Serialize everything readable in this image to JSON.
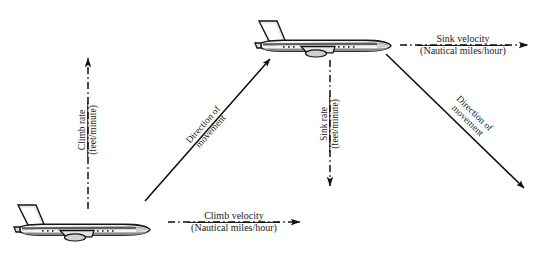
{
  "figure": {
    "background_color": "#ffffff",
    "line_color": "#1a1a1a",
    "width": 556,
    "height": 254
  },
  "labels": {
    "climb_rate": {
      "numerator": "Climb rate",
      "denominator": "(feet/minute)",
      "orientation": "vertical-up"
    },
    "climb_velocity": {
      "numerator": "Climb velocity",
      "denominator": "(Nautical miles/hour)",
      "orientation": "horizontal-right"
    },
    "sink_rate": {
      "numerator": "Sink rate",
      "denominator": "(feet/minute)",
      "orientation": "vertical-down"
    },
    "sink_velocity": {
      "numerator": "Sink velocity",
      "denominator": "(Nautical miles/hour)",
      "orientation": "horizontal-right"
    },
    "direction_climb": {
      "line1": "Direction of",
      "line2": "movement"
    },
    "direction_descent": {
      "line1": "Direction of",
      "line2": "movement"
    }
  },
  "aircraft": [
    {
      "name": "aircraft-lower-left",
      "position": "bottom-left",
      "heading": "right"
    },
    {
      "name": "aircraft-upper-middle",
      "position": "top-center",
      "heading": "right"
    }
  ],
  "vectors": [
    {
      "name": "climb-rate-vector",
      "style": "dash-dot",
      "direction": "up"
    },
    {
      "name": "climb-velocity-vector",
      "style": "dash-dot",
      "direction": "right"
    },
    {
      "name": "climb-movement-vector",
      "style": "solid",
      "direction": "up-right"
    },
    {
      "name": "sink-rate-vector",
      "style": "dash-dot",
      "direction": "down"
    },
    {
      "name": "sink-velocity-vector",
      "style": "dash-dot",
      "direction": "right"
    },
    {
      "name": "descent-movement-vector",
      "style": "solid",
      "direction": "down-right"
    }
  ]
}
